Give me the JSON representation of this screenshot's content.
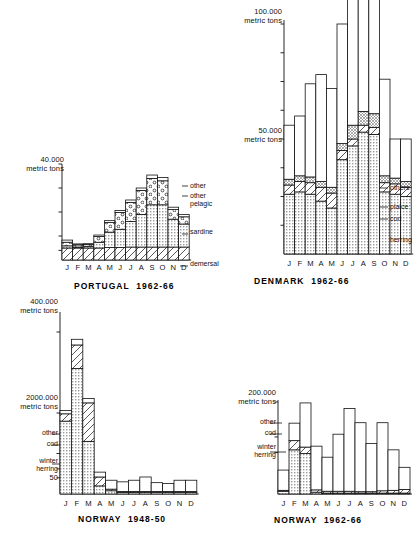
{
  "figure": {
    "background": "#ffffff",
    "ink": "#111111"
  },
  "months": [
    "J",
    "F",
    "M",
    "A",
    "M",
    "J",
    "J",
    "A",
    "S",
    "O",
    "N",
    "D"
  ],
  "charts": [
    {
      "id": "portugal",
      "title": "PORTUGAL  1962-66",
      "axis_top_label": "40.000\nmetric tons",
      "legend": [
        "other",
        "other\npelagic",
        "sardine",
        "demersal"
      ],
      "chart_data": {
        "type": "bar",
        "title": "PORTUGAL  1962-66",
        "subtitle": "",
        "xlabel": "",
        "ylabel": "metric tons",
        "ylim": [
          0,
          40000
        ],
        "grid": false,
        "legend_position": "right",
        "stacked": true,
        "categories": [
          "J",
          "F",
          "M",
          "A",
          "M",
          "J",
          "J",
          "A",
          "S",
          "O",
          "N",
          "D"
        ],
        "tick_labels": [
          "40.000 metric tons"
        ],
        "series": [
          {
            "name": "demersal",
            "values": [
              5000,
              5000,
              5000,
              5000,
              5200,
              5200,
              5400,
              5400,
              5400,
              5400,
              5400,
              5400
            ]
          },
          {
            "name": "sardine",
            "values": [
              900,
              400,
              700,
              2400,
              6400,
              7600,
              10600,
              13600,
              17600,
              17600,
              11600,
              9600
            ]
          },
          {
            "name": "other pelagic",
            "values": [
              1500,
              900,
              700,
              2400,
              4000,
              7000,
              8000,
              10000,
              11000,
              10000,
              4000,
              3000
            ]
          },
          {
            "name": "other",
            "values": [
              900,
              400,
              400,
              600,
              800,
              800,
              1000,
              1000,
              1400,
              1400,
              1000,
              1000
            ]
          }
        ]
      }
    },
    {
      "id": "denmark",
      "title": "DENMARK  1962-66",
      "axis_top_label": "100.000\nmetric tons",
      "axis_mid_label": "50.000\nmetric tons",
      "legend": [
        "others",
        "plaice",
        "cod",
        "herring"
      ],
      "chart_data": {
        "type": "bar",
        "title": "DENMARK  1962-66",
        "xlabel": "",
        "ylabel": "metric tons",
        "ylim": [
          0,
          100000
        ],
        "grid": false,
        "legend_position": "right",
        "stacked": true,
        "categories": [
          "J",
          "F",
          "M",
          "A",
          "M",
          "J",
          "J",
          "A",
          "S",
          "O",
          "N",
          "D"
        ],
        "tick_labels": [
          "100.000 metric tons",
          "50.000 metric tons"
        ],
        "series": [
          {
            "name": "herring",
            "values": [
              26000,
              27000,
              26000,
              23000,
              20000,
              41000,
              47000,
              53000,
              52000,
              27000,
              26000,
              25000
            ]
          },
          {
            "name": "cod",
            "values": [
              4000,
              4500,
              5000,
              6000,
              6500,
              4000,
              3000,
              3000,
              3000,
              4000,
              4500,
              4000
            ]
          },
          {
            "name": "plaice",
            "values": [
              2500,
              2500,
              2500,
              2500,
              2500,
              3000,
              6000,
              6000,
              6000,
              3000,
              2500,
              2500
            ]
          },
          {
            "name": "others",
            "values": [
              23500,
              26000,
              40500,
              46500,
              43000,
              52000,
              77000,
              54000,
              62000,
              42000,
              17000,
              18500
            ]
          }
        ]
      }
    },
    {
      "id": "norway_1948",
      "title": "NORWAY  1948-50",
      "axis_top_label": "400.000\nmetric tons",
      "axis_mid_label": "2000.000\nmetric tons",
      "axis_low_label": "50",
      "legend": [
        "other",
        "cod",
        "winter\nherring"
      ],
      "chart_data": {
        "type": "bar",
        "title": "NORWAY  1948-50",
        "xlabel": "",
        "ylabel": "metric tons",
        "ylim": [
          0,
          400000
        ],
        "grid": false,
        "legend_position": "left",
        "stacked": true,
        "categories": [
          "J",
          "F",
          "M",
          "A",
          "M",
          "J",
          "J",
          "A",
          "S",
          "O",
          "N",
          "D"
        ],
        "tick_labels": [
          "400.000 metric tons",
          "2000.000 metric tons",
          "50"
        ],
        "series": [
          {
            "name": "winter herring",
            "values": [
              180000,
              310000,
              130000,
              20000,
              8000,
              4000,
              4000,
              4000,
              4000,
              4000,
              4000,
              4000
            ]
          },
          {
            "name": "cod",
            "values": [
              18000,
              58000,
              95000,
              22000,
              4000,
              2000,
              2000,
              2000,
              2000,
              2000,
              2000,
              2000
            ]
          },
          {
            "name": "other",
            "values": [
              8000,
              14000,
              11000,
              12000,
              22000,
              24000,
              28000,
              36000,
              22000,
              20000,
              28000,
              28000
            ]
          }
        ]
      }
    },
    {
      "id": "norway_1962",
      "title": "NORWAY  1962-66",
      "axis_top_label": "200.000\nmetric tons",
      "legend": [
        "other",
        "cod",
        "winter\nherring"
      ],
      "chart_data": {
        "type": "bar",
        "title": "NORWAY  1962-66",
        "xlabel": "",
        "ylabel": "metric tons",
        "ylim": [
          0,
          200000
        ],
        "grid": false,
        "legend_position": "left",
        "stacked": true,
        "categories": [
          "J",
          "F",
          "M",
          "A",
          "M",
          "J",
          "J",
          "A",
          "S",
          "O",
          "N",
          "D"
        ],
        "tick_labels": [
          "200.000 metric tons"
        ],
        "series": [
          {
            "name": "winter herring",
            "values": [
              6000,
              96000,
              88000,
              4000,
              2000,
              2000,
              2000,
              2000,
              2000,
              2000,
              2000,
              2000
            ]
          },
          {
            "name": "cod",
            "values": [
              2000,
              20000,
              14000,
              5000,
              4000,
              4000,
              4000,
              3000,
              3000,
              5000,
              6000,
              8000
            ]
          },
          {
            "name": "other",
            "values": [
              44000,
              38000,
              96000,
              95000,
              74000,
              124000,
              180000,
              150000,
              105000,
              148000,
              88000,
              48000
            ]
          }
        ]
      }
    }
  ]
}
